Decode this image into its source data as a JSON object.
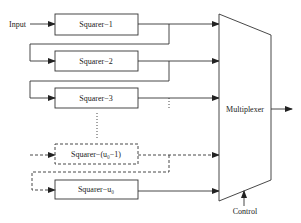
{
  "diagram": {
    "input_label": "Input",
    "control_label": "Control",
    "multiplexer_label": "Multiplexer",
    "squarers": [
      {
        "label": "Squarer−1"
      },
      {
        "label": "Squarer−2"
      },
      {
        "label": "Squarer−3"
      },
      {
        "label": "Squarer−(u₀−1)"
      },
      {
        "label": "Squarer−u₀"
      }
    ],
    "colors": {
      "stroke": "#333333",
      "text": "#222222",
      "background": "#ffffff"
    }
  }
}
